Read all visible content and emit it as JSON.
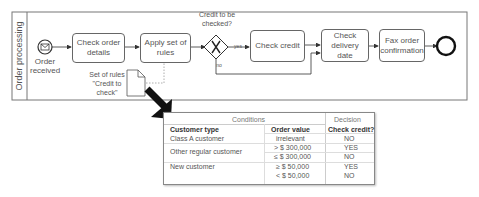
{
  "pool": {
    "lane_label": "Order processing"
  },
  "start_event": {
    "label": "Order received",
    "icon": "envelope-icon"
  },
  "tasks": [
    {
      "label": "Check order details"
    },
    {
      "label": "Apply set of rules"
    },
    {
      "label": "Check credit"
    },
    {
      "label": "Check delivery date"
    },
    {
      "label": "Fax order confirmation"
    }
  ],
  "gateway": {
    "question": "Credit to be checked?",
    "yes_label": "yes",
    "no_label": "no"
  },
  "data_object": {
    "label": "Set of rules \"Credit to check\""
  },
  "decision_table": {
    "group_conditions": "Conditions",
    "group_decision": "Decision",
    "columns": [
      "Customer type",
      "Order value",
      "Check credit?"
    ],
    "rows": [
      {
        "customer_type": "Class A customer",
        "order_value": "irrelevant",
        "check_credit": "NO"
      },
      {
        "customer_type": "Other regular customer",
        "order_value": "> $ 300,000",
        "check_credit": "YES"
      },
      {
        "customer_type": "",
        "order_value": "≤ $ 300,000",
        "check_credit": "NO"
      },
      {
        "customer_type": "New customer",
        "order_value": "≥ $ 50,000",
        "check_credit": "YES"
      },
      {
        "customer_type": "",
        "order_value": "< $ 50,000",
        "check_credit": "NO"
      }
    ]
  }
}
